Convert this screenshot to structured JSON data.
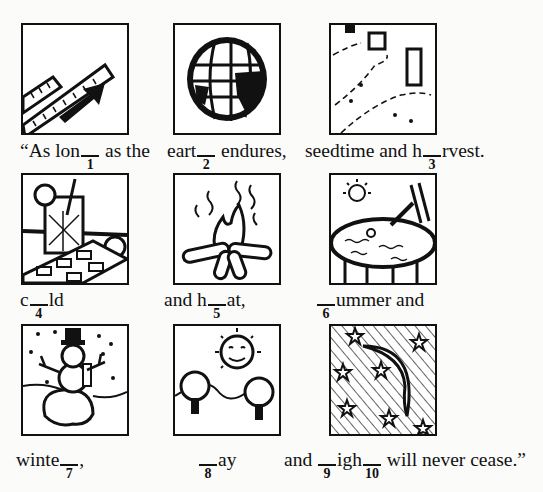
{
  "puzzle": {
    "tiles": [
      {
        "id": 1,
        "picture": "ruler-long-arrow"
      },
      {
        "id": 2,
        "picture": "earth-globe"
      },
      {
        "id": 3,
        "picture": "seeded-field-harvest"
      },
      {
        "id": 4,
        "picture": "cold-drink-ice"
      },
      {
        "id": 5,
        "picture": "campfire-heat"
      },
      {
        "id": 6,
        "picture": "summer-pool"
      },
      {
        "id": 7,
        "picture": "winter-snowman"
      },
      {
        "id": 8,
        "picture": "sunny-day"
      },
      {
        "id": 9,
        "picture": "night-moon-stars"
      }
    ],
    "row1": {
      "c1_pre": "“As lon",
      "c1_num": "1",
      "c1_post": " as the",
      "c2_pre": "eart",
      "c2_num": "2",
      "c2_post": " endures,",
      "c3_pre": "seedtime and h",
      "c3_num": "3",
      "c3_post": "rvest."
    },
    "row2": {
      "c1_pre": "c",
      "c1_num": "4",
      "c1_post": "ld",
      "c2_pre": "and h",
      "c2_num": "5",
      "c2_post": "at,",
      "c3_pre": "",
      "c3_num": "6",
      "c3_post": "ummer and"
    },
    "row3": {
      "c1_pre": "winte",
      "c1_num": "7",
      "c1_post": ",",
      "c2_pre": "",
      "c2_num": "8",
      "c2_post": "ay",
      "c3_pre": "and ",
      "c3_num": "9",
      "c3_mid": "igh",
      "c3_num2": "10",
      "c3_post": " will never cease.”"
    }
  }
}
